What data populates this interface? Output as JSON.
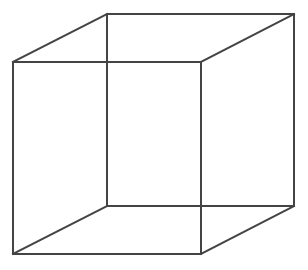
{
  "diagram": {
    "type": "wireframe-cube",
    "stroke_color": "#444444",
    "background_color": "#ffffff",
    "stroke_width": 2,
    "vertices": {
      "front_top_left": [
        13,
        62
      ],
      "front_top_right": [
        201,
        62
      ],
      "front_bottom_left": [
        13,
        254
      ],
      "front_bottom_right": [
        201,
        254
      ],
      "back_top_left": [
        107,
        14
      ],
      "back_top_right": [
        294,
        14
      ],
      "back_bottom_left": [
        107,
        206
      ],
      "back_bottom_right": [
        294,
        206
      ]
    },
    "edges": [
      [
        "front_top_left",
        "front_top_right"
      ],
      [
        "front_top_right",
        "front_bottom_right"
      ],
      [
        "front_bottom_right",
        "front_bottom_left"
      ],
      [
        "front_bottom_left",
        "front_top_left"
      ],
      [
        "back_top_left",
        "back_top_right"
      ],
      [
        "back_top_right",
        "back_bottom_right"
      ],
      [
        "back_bottom_right",
        "back_bottom_left"
      ],
      [
        "back_bottom_left",
        "back_top_left"
      ],
      [
        "front_top_left",
        "back_top_left"
      ],
      [
        "front_top_right",
        "back_top_right"
      ],
      [
        "front_bottom_left",
        "back_bottom_left"
      ],
      [
        "front_bottom_right",
        "back_bottom_right"
      ]
    ]
  }
}
